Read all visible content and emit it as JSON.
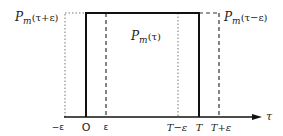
{
  "diagram": {
    "labels": {
      "left_curve": "P",
      "left_curve_sub": "m",
      "left_curve_arg": "(τ+ε)",
      "center_curve": "P",
      "center_curve_sub": "m",
      "center_curve_arg": "(τ)",
      "right_curve": "P",
      "right_curve_sub": "m",
      "right_curve_arg": "(τ−ε)"
    },
    "axis": {
      "label": "τ",
      "ticks": [
        "−ε",
        "O",
        "ε",
        "T−ε",
        "T",
        "T+ε"
      ]
    },
    "pulses": [
      {
        "name": "P_m(τ+ε)",
        "style": "dotted",
        "start": "−ε",
        "end": "T−ε"
      },
      {
        "name": "P_m(τ)",
        "style": "solid",
        "start": "O",
        "end": "T"
      },
      {
        "name": "P_m(τ−ε)",
        "style": "dashed",
        "start": "ε",
        "end": "T+ε"
      }
    ]
  }
}
